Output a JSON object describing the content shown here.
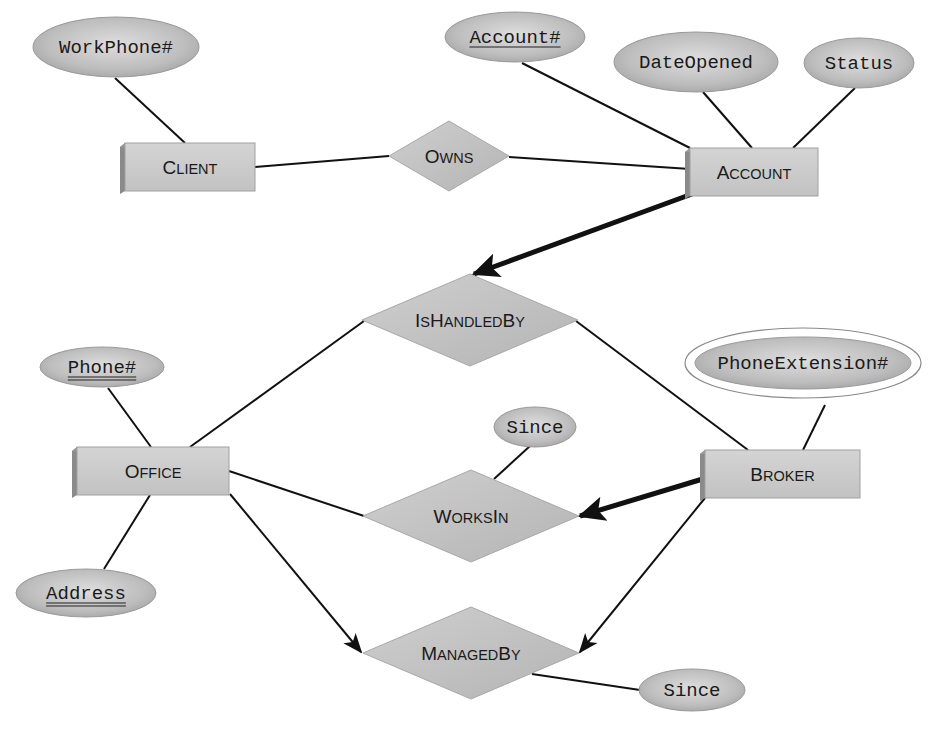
{
  "diagram": {
    "type": "er-diagram",
    "colors": {
      "fill": "#c4c4c4",
      "fill_light": "#d2d2d2",
      "shadow": "#8a8a8a",
      "stroke": "#111111",
      "ellipse_light": "#dcdcdc",
      "ellipse_dark": "#a8a8a8"
    },
    "entities": [
      {
        "id": "client",
        "name": "Client",
        "label_first": "C",
        "label_rest": "LIENT",
        "x": 125,
        "y": 143,
        "w": 130,
        "h": 48
      },
      {
        "id": "account",
        "name": "Account",
        "label_first": "A",
        "label_rest": "CCOUNT",
        "x": 690,
        "y": 148,
        "w": 128,
        "h": 48
      },
      {
        "id": "office",
        "name": "Office",
        "label_first": "O",
        "label_rest": "FFICE",
        "x": 77,
        "y": 447,
        "w": 152,
        "h": 48
      },
      {
        "id": "broker",
        "name": "Broker",
        "label_first": "B",
        "label_rest": "ROKER",
        "x": 705,
        "y": 450,
        "w": 155,
        "h": 48
      }
    ],
    "relationships": [
      {
        "id": "owns",
        "name": "Owns",
        "parts": [
          {
            "t": "O",
            "big": true
          },
          {
            "t": "WNS",
            "big": false
          }
        ],
        "cx": 449,
        "cy": 156,
        "hw": 60,
        "hh": 35
      },
      {
        "id": "ishandledby",
        "name": "IsHandledBy",
        "parts": [
          {
            "t": "I",
            "big": true
          },
          {
            "t": "S",
            "big": false
          },
          {
            "t": "H",
            "big": true
          },
          {
            "t": "ANDLED",
            "big": false
          },
          {
            "t": "B",
            "big": true
          },
          {
            "t": "Y",
            "big": false
          }
        ],
        "cx": 470,
        "cy": 320,
        "hw": 108,
        "hh": 46
      },
      {
        "id": "worksin",
        "name": "WorksIn",
        "parts": [
          {
            "t": "W",
            "big": true
          },
          {
            "t": "ORKS",
            "big": false
          },
          {
            "t": "I",
            "big": true
          },
          {
            "t": "N",
            "big": false
          }
        ],
        "cx": 471,
        "cy": 516,
        "hw": 108,
        "hh": 46
      },
      {
        "id": "managedby",
        "name": "ManagedBy",
        "parts": [
          {
            "t": "M",
            "big": true
          },
          {
            "t": "ANAGED",
            "big": false
          },
          {
            "t": "B",
            "big": true
          },
          {
            "t": "Y",
            "big": false
          }
        ],
        "cx": 471,
        "cy": 653,
        "hw": 108,
        "hh": 46
      }
    ],
    "attributes": [
      {
        "id": "workphone",
        "label": "WorkPhone#",
        "cx": 116,
        "cy": 47,
        "rx": 83,
        "ry": 30,
        "key": "none",
        "multivalued": false
      },
      {
        "id": "accountno",
        "label": "Account#",
        "cx": 515,
        "cy": 37,
        "rx": 70,
        "ry": 25,
        "key": "single",
        "multivalued": false
      },
      {
        "id": "dateopened",
        "label": "DateOpened",
        "cx": 696,
        "cy": 62,
        "rx": 82,
        "ry": 30,
        "key": "none",
        "multivalued": false
      },
      {
        "id": "status",
        "label": "Status",
        "cx": 859,
        "cy": 63,
        "rx": 55,
        "ry": 25,
        "key": "none",
        "multivalued": false
      },
      {
        "id": "phoneno",
        "label": "Phone#",
        "cx": 102,
        "cy": 367,
        "rx": 62,
        "ry": 20,
        "key": "double",
        "multivalued": false
      },
      {
        "id": "address",
        "label": "Address",
        "cx": 86,
        "cy": 593,
        "rx": 70,
        "ry": 24,
        "key": "double",
        "multivalued": false
      },
      {
        "id": "phoneext",
        "label": "PhoneExtension#",
        "cx": 803,
        "cy": 363,
        "rx": 108,
        "ry": 26,
        "key": "none",
        "multivalued": true
      },
      {
        "id": "since_worksin",
        "label": "Since",
        "cx": 535,
        "cy": 427,
        "rx": 41,
        "ry": 20,
        "key": "none",
        "multivalued": false
      },
      {
        "id": "since_managedby",
        "label": "Since",
        "cx": 692,
        "cy": 690,
        "rx": 53,
        "ry": 21,
        "key": "none",
        "multivalued": false
      }
    ],
    "lines": [
      {
        "from": "workphone",
        "to": "client",
        "x1": 115,
        "y1": 78,
        "x2": 185,
        "y2": 143,
        "style": "thin"
      },
      {
        "from": "client",
        "to": "owns",
        "x1": 255,
        "y1": 167,
        "x2": 389,
        "y2": 156,
        "style": "thin"
      },
      {
        "from": "owns",
        "to": "account",
        "x1": 509,
        "y1": 157,
        "x2": 690,
        "y2": 169,
        "style": "thin"
      },
      {
        "from": "accountno",
        "to": "account",
        "x1": 522,
        "y1": 63,
        "x2": 690,
        "y2": 148,
        "style": "thin"
      },
      {
        "from": "dateopened",
        "to": "account",
        "x1": 703,
        "y1": 92,
        "x2": 752,
        "y2": 148,
        "style": "thin"
      },
      {
        "from": "status",
        "to": "account",
        "x1": 855,
        "y1": 88,
        "x2": 793,
        "y2": 148,
        "style": "thin"
      },
      {
        "from": "account",
        "to": "ishandledby",
        "x1": 692,
        "y1": 194,
        "x2": 474,
        "y2": 274,
        "style": "thick-arrow"
      },
      {
        "from": "ishandledby",
        "to": "office",
        "x1": 364,
        "y1": 321,
        "x2": 190,
        "y2": 447,
        "style": "thin"
      },
      {
        "from": "ishandledby",
        "to": "broker",
        "x1": 576,
        "y1": 321,
        "x2": 748,
        "y2": 450,
        "style": "thin"
      },
      {
        "from": "phoneno",
        "to": "office",
        "x1": 108,
        "y1": 388,
        "x2": 151,
        "y2": 447,
        "style": "thin"
      },
      {
        "from": "office",
        "to": "address",
        "x1": 150,
        "y1": 495,
        "x2": 104,
        "y2": 569,
        "style": "thin"
      },
      {
        "from": "phoneext",
        "to": "broker",
        "x1": 825,
        "y1": 405,
        "x2": 803,
        "y2": 450,
        "style": "thin"
      },
      {
        "from": "office",
        "to": "worksin",
        "x1": 229,
        "y1": 471,
        "x2": 364,
        "y2": 516,
        "style": "thin"
      },
      {
        "from": "since_worksin",
        "to": "worksin",
        "x1": 530,
        "y1": 446,
        "x2": 494,
        "y2": 479,
        "style": "thin"
      },
      {
        "from": "broker",
        "to": "worksin",
        "x1": 706,
        "y1": 478,
        "x2": 580,
        "y2": 516,
        "style": "thick-arrow"
      },
      {
        "from": "office",
        "to": "managedby",
        "x1": 230,
        "y1": 494,
        "x2": 361,
        "y2": 652,
        "style": "thin-arrow"
      },
      {
        "from": "broker",
        "to": "managedby",
        "x1": 705,
        "y1": 498,
        "x2": 580,
        "y2": 652,
        "style": "thin-arrow"
      },
      {
        "from": "managedby",
        "to": "since_managedby",
        "x1": 532,
        "y1": 674,
        "x2": 640,
        "y2": 690,
        "style": "thin"
      }
    ]
  }
}
